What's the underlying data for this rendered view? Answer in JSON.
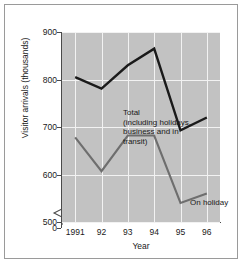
{
  "chart_data": {
    "type": "line",
    "title": "",
    "xlabel": "Year",
    "ylabel": "Visitor arrivals (thousands)",
    "x": [
      "1991",
      "92",
      "93",
      "94",
      "95",
      "96"
    ],
    "categories": [
      "1991",
      "92",
      "93",
      "94",
      "95",
      "96"
    ],
    "xtick_labels": [
      "1991",
      "92",
      "93",
      "94",
      "95",
      "96"
    ],
    "ytick_labels": [
      "0",
      "500",
      "600",
      "700",
      "800",
      "900"
    ],
    "ylim": [
      500,
      900
    ],
    "yticks": [
      500,
      600,
      700,
      800,
      900
    ],
    "y_axis_break": true,
    "y_axis_break_note": "axis broken between 0 and 500",
    "grid": true,
    "legend_position": "inline annotations",
    "series": [
      {
        "name": "Total (including holidays, business and in transit)",
        "color": "#1a1a1a",
        "values": [
          805,
          781,
          830,
          865,
          693,
          720
        ]
      },
      {
        "name": "On holiday",
        "color": "#6e6e6e",
        "values": [
          678,
          607,
          682,
          682,
          540,
          560
        ]
      }
    ],
    "annotations": [
      {
        "name": "total-label",
        "text": "Total\n(including holidays,\nbusiness and in\ntransit)"
      },
      {
        "name": "on-holiday-label",
        "text": "On holiday"
      }
    ],
    "plot_background": "#c2c2c2",
    "gridline_color": "#f2f2f2",
    "frame_border_color": "#9a9a9a"
  },
  "axis": {
    "y_title": "Visitor arrivals (thousands)",
    "x_title": "Year",
    "y_ticks": [
      {
        "label": "900",
        "value": 900
      },
      {
        "label": "800",
        "value": 800
      },
      {
        "label": "700",
        "value": 700
      },
      {
        "label": "600",
        "value": 600
      },
      {
        "label": "500",
        "value": 500
      },
      {
        "label": "0",
        "value": 0
      }
    ],
    "x_ticks": [
      {
        "label": "1991"
      },
      {
        "label": "92"
      },
      {
        "label": "93"
      },
      {
        "label": "94"
      },
      {
        "label": "95"
      },
      {
        "label": "96"
      }
    ]
  },
  "annotations": {
    "total": {
      "line1": "Total",
      "line2": "(including holidays,",
      "line3": "business and in",
      "line4": "transit)"
    },
    "on_holiday": "On holiday"
  }
}
